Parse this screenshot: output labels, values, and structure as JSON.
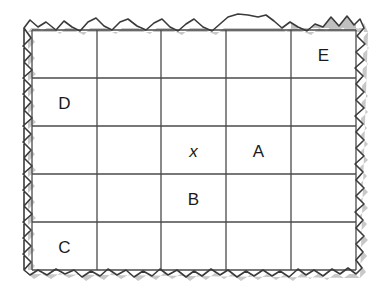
{
  "figure": {
    "kind": "grid-diagram",
    "paper_color": "#ffffff",
    "shade_color": "#c0c0c0",
    "line_color": "#4a4a4a",
    "edge_color": "#3a3a3a",
    "shadow_color": "#b5b5b5",
    "label_color": "#1a1a1a",
    "grid": {
      "rows": 5,
      "cols": 5,
      "x_edges": [
        32,
        97,
        161,
        226,
        291,
        356
      ],
      "y_edges": [
        30,
        78,
        126,
        174,
        222,
        270
      ]
    },
    "cells": [
      {
        "row": 1,
        "col": 5,
        "label": "E",
        "shaded": true,
        "italic": false
      },
      {
        "row": 2,
        "col": 1,
        "label": "D",
        "shaded": true,
        "italic": false
      },
      {
        "row": 3,
        "col": 3,
        "label": "x",
        "shaded": true,
        "italic": true
      },
      {
        "row": 3,
        "col": 4,
        "label": "A",
        "shaded": true,
        "italic": false
      },
      {
        "row": 4,
        "col": 3,
        "label": "B",
        "shaded": true,
        "italic": false
      },
      {
        "row": 5,
        "col": 1,
        "label": "C",
        "shaded": true,
        "italic": false
      }
    ],
    "labels": {
      "E": "E",
      "D": "D",
      "x": "x",
      "A": "A",
      "B": "B",
      "C": "C"
    },
    "torn_edges": {
      "top": "M 24 28 L 30 20 L 38 27 L 46 22 L 56 30 L 64 21 L 72 27 L 80 31 L 88 22 L 96 18 L 104 26 L 112 30 L 120 22 L 128 19 L 137 26 L 146 30 L 154 23 L 162 19 L 170 27 L 178 31 L 186 24 L 194 19 L 203 27 L 212 31 L 220 24 L 228 17 L 238 14 L 248 15 L 258 17 L 266 15 L 274 21 L 282 28 L 290 22 L 298 27 L 307 31 L 315 24 L 323 27 L 331 17 L 339 26 L 347 16 L 354 25 L 360 19 L 364 28",
      "right": "M 364 28 L 357 36 L 365 44 L 356 52 L 364 60 L 355 68 L 363 76 L 356 84 L 364 92 L 356 100 L 364 108 L 355 116 L 363 124 L 356 132 L 364 140 L 356 148 L 364 156 L 355 164 L 363 172 L 356 180 L 364 188 L 356 196 L 364 204 L 355 212 L 363 220 L 356 228 L 364 236 L 356 244 L 363 252 L 356 260 L 362 268 L 356 274",
      "bottom": "M 356 274 L 348 268 L 340 274 L 332 269 L 323 276 L 314 270 L 306 275 L 298 269 L 289 277 L 280 271 L 272 276 L 263 270 L 254 276 L 246 271 L 237 277 L 228 270 L 220 275 L 211 269 L 202 276 L 194 271 L 186 277 L 177 270 L 168 275 L 160 269 L 152 276 L 143 271 L 134 277 L 126 270 L 117 275 L 108 269 L 100 276 L 91 271 L 82 277 L 74 270 L 65 274 L 56 269 L 47 275 L 38 270 L 30 275 L 24 270",
      "left": "M 24 270 L 31 262 L 23 254 L 31 246 L 23 238 L 31 230 L 23 222 L 32 214 L 24 206 L 31 198 L 23 190 L 31 182 L 23 174 L 32 166 L 24 158 L 31 150 L 23 142 L 31 134 L 23 126 L 32 118 L 24 110 L 31 102 L 23 94 L 31 86 L 23 78 L 32 70 L 24 62 L 31 54 L 23 46 L 31 38 L 24 28"
    }
  }
}
